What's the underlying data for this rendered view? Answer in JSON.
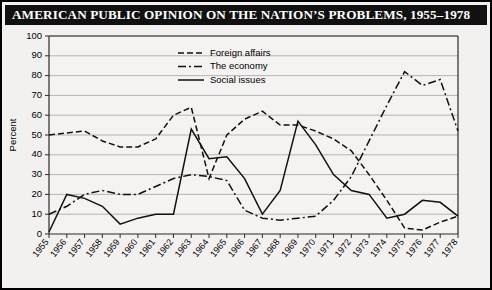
{
  "title": "AMERICAN PUBLIC OPINION ON THE NATION’S PROBLEMS, 1955–1978",
  "colors": {
    "line": "#111111",
    "grid": "#9a9a9a",
    "axis": "#2b2b2b",
    "background": "#f2f1ef",
    "plot_background": "#f4f3f1",
    "title_background": "#111111",
    "title_text": "#ffffff"
  },
  "legend": {
    "position": "top-center",
    "entries": [
      {
        "label": "Foreign affairs",
        "dash": "6,3",
        "key": "foreign_affairs"
      },
      {
        "label": "The economy",
        "dash": "8,3,2,3",
        "key": "the_economy"
      },
      {
        "label": "Social issues",
        "dash": "none",
        "key": "social_issues"
      }
    ]
  },
  "chart_data": {
    "type": "line",
    "title": "AMERICAN PUBLIC OPINION ON THE NATION’S PROBLEMS, 1955–1978",
    "xlabel": "",
    "ylabel": "Percent",
    "xlim": [
      1955,
      1978
    ],
    "ylim": [
      0,
      100
    ],
    "ytick_step": 10,
    "grid": true,
    "categories": [
      "1955",
      "1956",
      "1957",
      "1958",
      "1959",
      "1960",
      "1961",
      "1962",
      "1963",
      "1964",
      "1965",
      "1966",
      "1967",
      "1968",
      "1969",
      "1970",
      "1971",
      "1972",
      "1973",
      "1974",
      "1975",
      "1976",
      "1977",
      "1978"
    ],
    "yticks": [
      0,
      10,
      20,
      30,
      40,
      50,
      60,
      70,
      80,
      90,
      100
    ],
    "series": [
      {
        "name": "Foreign affairs",
        "values": [
          50,
          51,
          52,
          47,
          44,
          44,
          45,
          48,
          55,
          60,
          61,
          63,
          64,
          28,
          32,
          50,
          58,
          62,
          55,
          55,
          52,
          48,
          42,
          30
        ]
      },
      {
        "name": "The economy",
        "values": [
          10,
          14,
          20,
          22,
          20,
          20,
          24,
          28,
          30,
          44,
          30,
          14,
          8,
          7,
          8,
          18,
          26,
          29,
          30,
          29,
          32,
          57,
          82,
          75
        ]
      },
      {
        "name": "Social issues",
        "values": [
          1,
          20,
          18,
          14,
          5,
          8,
          10,
          10,
          12,
          53,
          38,
          39,
          28,
          10,
          22,
          40,
          57,
          45,
          30,
          22,
          8,
          10,
          17,
          16
        ]
      }
    ],
    "series_by_year": {
      "foreign_affairs": {
        "1955": 50,
        "1956": 51,
        "1957": 52,
        "1958": 47,
        "1959": 44,
        "1960": 44,
        "1961": 48,
        "1962": 60,
        "1963": 64,
        "1964": 28,
        "1965": 50,
        "1966": 58,
        "1967": 62,
        "1968": 55,
        "1969": 55,
        "1970": 52,
        "1971": 48,
        "1972": 42,
        "1973": 30,
        "1974": 17,
        "1975": 3,
        "1976": 2,
        "1977": 6,
        "1978": 9
      },
      "the_economy": {
        "1955": 10,
        "1956": 14,
        "1957": 20,
        "1958": 22,
        "1959": 20,
        "1960": 20,
        "1961": 24,
        "1962": 28,
        "1963": 30,
        "1964": 29,
        "1965": 27,
        "1966": 12,
        "1967": 8,
        "1968": 7,
        "1969": 8,
        "1970": 9,
        "1971": 17,
        "1972": 29,
        "1973": 47,
        "1974": 65,
        "1975": 82,
        "1976": 75,
        "1977": 78,
        "1978": 52
      },
      "social_issues": {
        "1955": 1,
        "1956": 20,
        "1957": 18,
        "1958": 14,
        "1959": 5,
        "1960": 8,
        "1961": 10,
        "1962": 10,
        "1963": 53,
        "1964": 38,
        "1965": 39,
        "1966": 28,
        "1967": 10,
        "1968": 22,
        "1969": 57,
        "1970": 45,
        "1971": 30,
        "1972": 22,
        "1973": 20,
        "1974": 8,
        "1975": 10,
        "1976": 17,
        "1977": 16,
        "1978": 9
      }
    }
  }
}
